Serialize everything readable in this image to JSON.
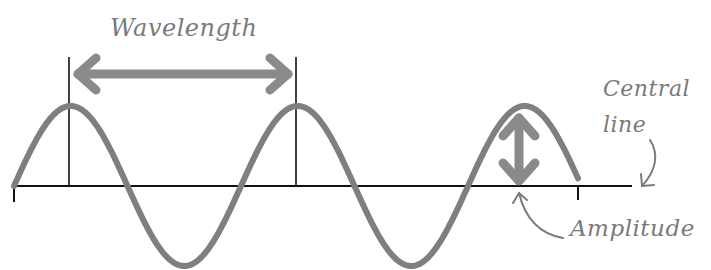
{
  "diagram": {
    "labels": {
      "wavelength": "Wavelength",
      "central_line_1": "Central",
      "central_line_2": "line",
      "amplitude": "Amplitude"
    },
    "colors": {
      "wave": "#7f7f7f",
      "arrows": "#8a8a8a",
      "lines": "#111111",
      "text": "#7a7a7a",
      "background": "#ffffff"
    },
    "geometry": {
      "central_line_y": 186,
      "central_line_x_start": 14,
      "central_line_x_end": 632,
      "wave_start_x": 14,
      "wave_end_x": 578,
      "wavelength_px": 227,
      "amplitude_px": 80,
      "peaks_x": [
        69,
        296,
        523
      ],
      "troughs_x": [
        183,
        410
      ]
    }
  }
}
